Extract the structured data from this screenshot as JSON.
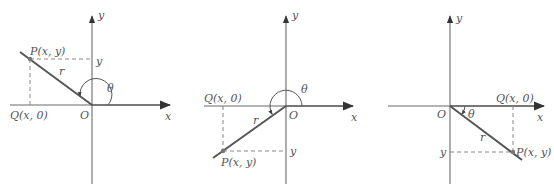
{
  "diagrams": [
    {
      "id": "quadrant-2",
      "axis_x_label": "x",
      "axis_y_label": "y",
      "origin_label": "O",
      "point_label": "P(x, y)",
      "projection_label": "Q(x, 0)",
      "y_tick_label": "y",
      "radius_label": "r",
      "angle_label": "θ"
    },
    {
      "id": "quadrant-3",
      "axis_x_label": "x",
      "axis_y_label": "y",
      "origin_label": "O",
      "point_label": "P(x, y)",
      "projection_label": "Q(x, 0)",
      "y_tick_label": "y",
      "radius_label": "r",
      "angle_label": "θ"
    },
    {
      "id": "quadrant-4",
      "axis_x_label": "x",
      "axis_y_label": "y",
      "origin_label": "O",
      "point_label": "P(x, y)",
      "projection_label": "Q(x, 0)",
      "y_tick_label": "y",
      "radius_label": "r",
      "angle_label": "θ"
    }
  ],
  "colors": {
    "axis": "#6b6b6b",
    "radius": "#555555",
    "dashed": "#8a8a8a",
    "text": "#555555"
  }
}
